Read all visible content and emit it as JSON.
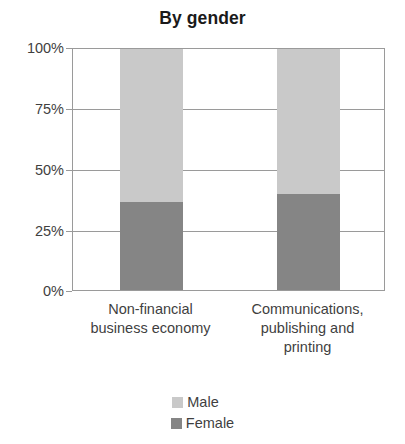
{
  "chart_data": {
    "type": "bar",
    "subtype": "stacked-percentage",
    "title": "By gender",
    "xlabel": "",
    "ylabel": "",
    "ylim": [
      0,
      100
    ],
    "yunit": "%",
    "grid": true,
    "legend_position": "bottom-center",
    "categories": [
      "Non-financial business economy",
      "Communications, publishing and printing"
    ],
    "category_lines": [
      [
        "Non-financial",
        "business economy"
      ],
      [
        "Communications,",
        "publishing and",
        "printing"
      ]
    ],
    "ytick_labels": [
      "100%",
      "75%",
      "50%",
      "25%",
      "0%"
    ],
    "ytick_values": [
      100,
      75,
      50,
      25,
      0
    ],
    "series": [
      {
        "name": "Male",
        "color": "#c9c9c9",
        "values": [
          63.5,
          60.0
        ]
      },
      {
        "name": "Female",
        "color": "#858585",
        "values": [
          36.5,
          40.0
        ]
      }
    ]
  },
  "colors": {
    "male": "#c9c9c9",
    "female": "#858585",
    "axis": "#9a9a9a",
    "text": "#3f3f3f",
    "title": "#1a1a1a",
    "background": "#ffffff"
  }
}
